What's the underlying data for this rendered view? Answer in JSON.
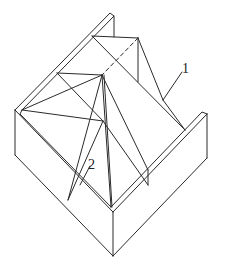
{
  "figure": {
    "type": "line-diagram",
    "stroke_color": "#2a2a2a",
    "background": "#ffffff"
  },
  "labels": [
    {
      "id": "label-1",
      "text": "1",
      "x": 184,
      "y": 62
    },
    {
      "id": "label-2",
      "text": "2",
      "x": 88,
      "y": 158
    }
  ]
}
